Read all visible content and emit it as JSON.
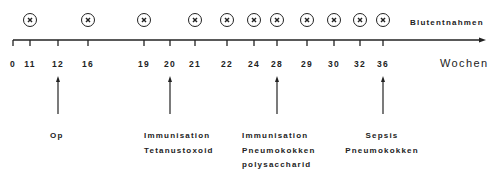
{
  "diagram": {
    "axis_label": "Wochen",
    "sampling_label": "Blutentnahmen",
    "ticks": [
      {
        "label": "0",
        "x": 13
      },
      {
        "label": "11",
        "x": 30
      },
      {
        "label": "12",
        "x": 58
      },
      {
        "label": "16",
        "x": 88
      },
      {
        "label": "19",
        "x": 144
      },
      {
        "label": "20",
        "x": 170
      },
      {
        "label": "21",
        "x": 195
      },
      {
        "label": "22",
        "x": 227
      },
      {
        "label": "24",
        "x": 254
      },
      {
        "label": "28",
        "x": 277
      },
      {
        "label": "29",
        "x": 307
      },
      {
        "label": "30",
        "x": 334
      },
      {
        "label": "32",
        "x": 360
      },
      {
        "label": "36",
        "x": 383
      }
    ],
    "blood_samples_weeks": [
      "11",
      "16",
      "19",
      "21",
      "22",
      "24",
      "28",
      "29",
      "30",
      "32",
      "36"
    ],
    "sample_marker_icon": "circled-x-icon",
    "events": [
      {
        "week": "12",
        "lines": [
          "Op"
        ]
      },
      {
        "week": "20",
        "lines": [
          "Immunisation",
          "Tetanustoxoid"
        ]
      },
      {
        "week": "28",
        "lines": [
          "Immunisation",
          "Pneumokokken",
          "polysaccharid"
        ]
      },
      {
        "week": "36",
        "lines": [
          "Sepsis",
          "Pneumokokken"
        ]
      }
    ],
    "colors": {
      "ink": "#222222",
      "background": "#ffffff"
    }
  }
}
